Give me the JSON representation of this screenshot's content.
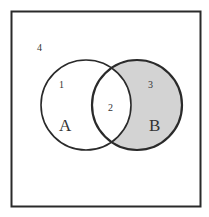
{
  "diagram": {
    "type": "venn",
    "universe": {
      "region_label": "4"
    },
    "sets": [
      {
        "name": "A",
        "region_label": "1",
        "fill": "#ffffff"
      },
      {
        "name": "B",
        "region_label": "3",
        "fill": "#d3d3d3"
      }
    ],
    "intersection": {
      "region_label": "2",
      "fill": "#ffffff"
    },
    "shaded_region": "B minus A",
    "colors": {
      "stroke": "#2a2a2a",
      "shade": "#d3d3d3",
      "background": "#ffffff"
    }
  }
}
